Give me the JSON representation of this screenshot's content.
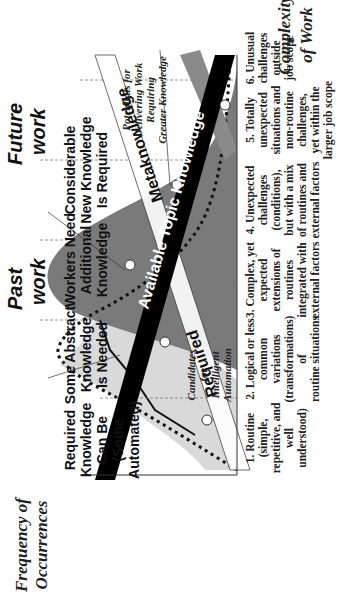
{
  "diagram": {
    "axes": {
      "y_title_line1": "Frequency of",
      "y_title_line2": "Occurrences",
      "x_title_line1": "Complexity",
      "x_title_line2": "of Work"
    },
    "eras": {
      "past": {
        "line1": "Past",
        "line2": "work"
      },
      "future": {
        "line1": "Future",
        "line2": "work"
      }
    },
    "knowledge_headings": [
      {
        "lines": [
          "Required",
          "Knowledge",
          "Can Be",
          "Automated",
          "(Some",
          "Automated)"
        ]
      },
      {
        "lines": [
          "Some Abstract",
          "Knowledge",
          "Is Needed"
        ]
      },
      {
        "lines": [
          "Workers Need",
          "Additional",
          "Knowledge"
        ]
      },
      {
        "lines": [
          "Considerable",
          "New Knowledge",
          "Is Required"
        ]
      }
    ],
    "bands": {
      "available": "Available Topic Knowledge",
      "required": "Required",
      "metaknowledge": "Metaknowledge"
    },
    "notes": {
      "automation": [
        "Candidates",
        "for",
        "Intelligent",
        "Automation"
      ],
      "potentials": [
        "Potentials for",
        "Delivering Work",
        "Requiring",
        "Greater Knowledge"
      ]
    },
    "columns": [
      {
        "lines": [
          "1. Routine",
          "(simple,",
          "repetitive, and",
          "well",
          "understood)"
        ]
      },
      {
        "lines": [
          "2. Logical or less",
          "common",
          "variations",
          "(transformations)",
          "of",
          "routine situations"
        ]
      },
      {
        "lines": [
          "3. Complex, yet",
          "expected",
          "extensions of",
          "routines",
          "integrated with",
          "external factors"
        ]
      },
      {
        "lines": [
          "4. Unexpected",
          "challenges",
          "(conditions),",
          "but with a mix",
          "of routines and",
          "external factors"
        ]
      },
      {
        "lines": [
          "5. Totally",
          "unexpected",
          "situations and",
          "non-routine",
          "challenges,",
          "yet within the",
          "larger job scope"
        ]
      },
      {
        "lines": [
          "6. Unusual",
          "challenges",
          "outside",
          "job scope"
        ]
      }
    ],
    "colors": {
      "past_fill": "#d9d9d9",
      "future_fill": "#7a7a7a",
      "band_black": "#000000",
      "band_gray": "#8a8a8a",
      "grid": "#777777"
    }
  }
}
